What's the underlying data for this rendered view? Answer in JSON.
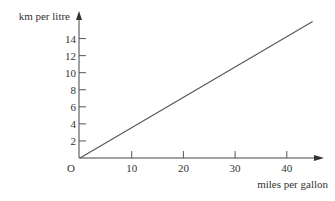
{
  "chart_data": {
    "type": "line",
    "title": "",
    "xlabel": "miles per gallon",
    "ylabel": "km per litre",
    "origin_label": "O",
    "xlim": [
      0,
      45
    ],
    "ylim": [
      0,
      16
    ],
    "x_ticks": [
      10,
      20,
      30,
      40
    ],
    "y_ticks": [
      2,
      4,
      6,
      8,
      10,
      12,
      14
    ],
    "grid": false,
    "legend": "none",
    "series": [
      {
        "name": "conversion",
        "x": [
          0,
          45
        ],
        "y": [
          0,
          16
        ]
      }
    ]
  }
}
